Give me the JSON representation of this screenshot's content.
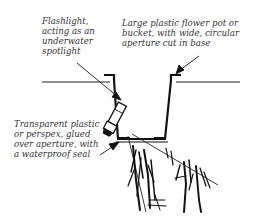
{
  "diagram": {
    "labels": {
      "flashlight": "Flashlight,\nacting as an\nunderwater\nspotlight",
      "pot": "Large plastic flower pot or\nbucket, with wide, circular\naperture cut in base",
      "panel": "Transparent plastic\nor perspex, glued\nover aperture, with\na waterproof seal"
    },
    "components": [
      {
        "id": "water-surface",
        "label": "Water surface line"
      },
      {
        "id": "flower-pot",
        "label": "Large plastic flower pot or bucket"
      },
      {
        "id": "flashlight",
        "label": "Flashlight"
      },
      {
        "id": "transparent-panel",
        "label": "Transparent plastic or perspex panel"
      },
      {
        "id": "light-beam",
        "label": "Light beam"
      },
      {
        "id": "pond-plants",
        "label": "Submerged plants"
      }
    ],
    "colors": {
      "ink": "#111111",
      "text": "#333333",
      "background": "#ffffff"
    }
  }
}
